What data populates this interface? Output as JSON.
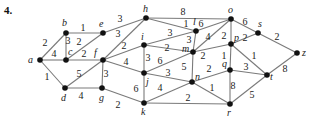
{
  "problem_number": "4.",
  "graph": {
    "nodes": [
      {
        "id": "a",
        "x": 40,
        "y": 60,
        "lx": 28,
        "ly": 63
      },
      {
        "id": "b",
        "x": 66,
        "y": 33,
        "lx": 62,
        "ly": 26
      },
      {
        "id": "c",
        "x": 66,
        "y": 60,
        "lx": 68,
        "ly": 55
      },
      {
        "id": "d",
        "x": 65,
        "y": 88,
        "lx": 61,
        "ly": 101
      },
      {
        "id": "e",
        "x": 103,
        "y": 33,
        "lx": 99,
        "ly": 27
      },
      {
        "id": "f",
        "x": 103,
        "y": 60,
        "lx": 94,
        "ly": 56
      },
      {
        "id": "g",
        "x": 102,
        "y": 88,
        "lx": 99,
        "ly": 101
      },
      {
        "id": "h",
        "x": 146,
        "y": 18,
        "lx": 143,
        "ly": 12
      },
      {
        "id": "i",
        "x": 144,
        "y": 45,
        "lx": 141,
        "ly": 40
      },
      {
        "id": "j",
        "x": 144,
        "y": 73,
        "lx": 146,
        "ly": 85
      },
      {
        "id": "k",
        "x": 144,
        "y": 103,
        "lx": 141,
        "ly": 115
      },
      {
        "id": "l",
        "x": 196,
        "y": 31,
        "lx": 193,
        "ly": 25
      },
      {
        "id": "m",
        "x": 193,
        "y": 52,
        "lx": 182,
        "ly": 52
      },
      {
        "id": "n",
        "x": 192,
        "y": 82,
        "lx": 195,
        "ly": 80
      },
      {
        "id": "o",
        "x": 231,
        "y": 19,
        "lx": 228,
        "ly": 13
      },
      {
        "id": "p",
        "x": 231,
        "y": 44,
        "lx": 234,
        "ly": 41
      },
      {
        "id": "q",
        "x": 230,
        "y": 70,
        "lx": 222,
        "ly": 67
      },
      {
        "id": "r",
        "x": 230,
        "y": 104,
        "lx": 227,
        "ly": 116
      },
      {
        "id": "s",
        "x": 258,
        "y": 33,
        "lx": 258,
        "ly": 27
      },
      {
        "id": "t",
        "x": 267,
        "y": 75,
        "lx": 270,
        "ly": 80
      },
      {
        "id": "z",
        "x": 297,
        "y": 53,
        "lx": 302,
        "ly": 56
      }
    ],
    "edges": [
      {
        "from": "a",
        "to": "b",
        "w": "2",
        "wx": 45,
        "wy": 46
      },
      {
        "from": "a",
        "to": "c",
        "w": "4",
        "wx": 54,
        "wy": 57
      },
      {
        "from": "a",
        "to": "d",
        "w": "1",
        "wx": 47,
        "wy": 80
      },
      {
        "from": "b",
        "to": "e",
        "w": "1",
        "wx": 83,
        "wy": 31
      },
      {
        "from": "b",
        "to": "c",
        "w": "3",
        "wx": 68,
        "wy": 44
      },
      {
        "from": "c",
        "to": "e",
        "w": "2",
        "wx": 79,
        "wy": 45
      },
      {
        "from": "c",
        "to": "f",
        "w": "2",
        "wx": 84,
        "wy": 57
      },
      {
        "from": "d",
        "to": "f",
        "w": "5",
        "wx": 79,
        "wy": 77
      },
      {
        "from": "d",
        "to": "g",
        "w": "4",
        "wx": 81,
        "wy": 99
      },
      {
        "from": "e",
        "to": "h",
        "w": "3",
        "wx": 120,
        "wy": 22
      },
      {
        "from": "f",
        "to": "h",
        "w": "3",
        "wx": 118,
        "wy": 37
      },
      {
        "from": "f",
        "to": "i",
        "w": "2",
        "wx": 124,
        "wy": 49
      },
      {
        "from": "f",
        "to": "j",
        "w": "4",
        "wx": 126,
        "wy": 65
      },
      {
        "from": "f",
        "to": "g",
        "w": "3",
        "wx": 106,
        "wy": 77
      },
      {
        "from": "g",
        "to": "k",
        "w": "2",
        "wx": 118,
        "wy": 108
      },
      {
        "from": "h",
        "to": "o",
        "w": "8",
        "wx": 183,
        "wy": 15
      },
      {
        "from": "h",
        "to": "l",
        "w": "1",
        "wx": 186,
        "wy": 27
      },
      {
        "from": "l",
        "to": "o",
        "w": "6",
        "wx": 201,
        "wy": 27
      },
      {
        "from": "i",
        "to": "l",
        "w": "3",
        "wx": 170,
        "wy": 36
      },
      {
        "from": "l",
        "to": "m",
        "w": "3",
        "wx": 189,
        "wy": 43
      },
      {
        "from": "i",
        "to": "m",
        "w": "2",
        "wx": 167,
        "wy": 51
      },
      {
        "from": "m",
        "to": "o",
        "w": "4",
        "wx": 208,
        "wy": 40
      },
      {
        "from": "i",
        "to": "j",
        "w": "3",
        "wx": 148,
        "wy": 61
      },
      {
        "from": "j",
        "to": "m",
        "w": "6",
        "wx": 160,
        "wy": 64
      },
      {
        "from": "j",
        "to": "n",
        "w": "3",
        "wx": 168,
        "wy": 76
      },
      {
        "from": "j",
        "to": "k",
        "w": "6",
        "wx": 136,
        "wy": 92
      },
      {
        "from": "k",
        "to": "n",
        "w": "4",
        "wx": 160,
        "wy": 91
      },
      {
        "from": "m",
        "to": "n",
        "w": "5",
        "wx": 184,
        "wy": 70
      },
      {
        "from": "m",
        "to": "p",
        "w": "2",
        "wx": 203,
        "wy": 59
      },
      {
        "from": "o",
        "to": "p",
        "w": "2",
        "wx": 224,
        "wy": 39
      },
      {
        "from": "o",
        "to": "s",
        "w": "6",
        "wx": 245,
        "wy": 25
      },
      {
        "from": "p",
        "to": "s",
        "w": "2",
        "wx": 245,
        "wy": 41
      },
      {
        "from": "s",
        "to": "z",
        "w": "2",
        "wx": 277,
        "wy": 40
      },
      {
        "from": "p",
        "to": "q",
        "w": "1",
        "wx": 224,
        "wy": 59
      },
      {
        "from": "p",
        "to": "t",
        "w": "1",
        "wx": 254,
        "wy": 59
      },
      {
        "from": "q",
        "to": "t",
        "w": "3",
        "wx": 246,
        "wy": 70
      },
      {
        "from": "q",
        "to": "r",
        "w": "8",
        "wx": 233,
        "wy": 89
      },
      {
        "from": "n",
        "to": "q",
        "w": "2",
        "wx": 209,
        "wy": 72
      },
      {
        "from": "n",
        "to": "r",
        "w": "1",
        "wx": 212,
        "wy": 91
      },
      {
        "from": "k",
        "to": "r",
        "w": "2",
        "wx": 188,
        "wy": 101
      },
      {
        "from": "r",
        "to": "t",
        "w": "5",
        "wx": 252,
        "wy": 98
      },
      {
        "from": "t",
        "to": "z",
        "w": "8",
        "wx": 285,
        "wy": 72
      }
    ]
  }
}
